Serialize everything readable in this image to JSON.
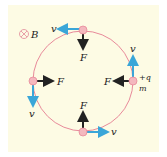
{
  "figure": {
    "field": {
      "symbol": "B",
      "direction": "into-page",
      "icon": "cross-circle-icon"
    },
    "charge": {
      "sign": "+q",
      "mass": "m"
    },
    "force_label": "F",
    "velocity_label": "v",
    "colors": {
      "background": "#fdfbe4",
      "orbit": "#e88a9a",
      "charge": "#f4b8be",
      "velocity": "#3aa6d8",
      "force": "#222222"
    },
    "positions": [
      {
        "name": "top",
        "velocity_dir": "left",
        "force_dir": "down"
      },
      {
        "name": "right",
        "velocity_dir": "up",
        "force_dir": "left"
      },
      {
        "name": "bottom",
        "velocity_dir": "right",
        "force_dir": "up"
      },
      {
        "name": "left",
        "velocity_dir": "down",
        "force_dir": "right"
      }
    ]
  }
}
